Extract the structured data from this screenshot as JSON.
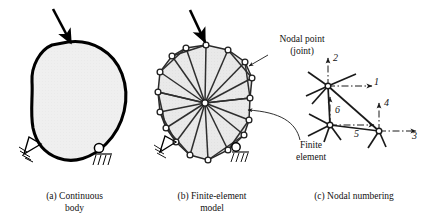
{
  "figure": {
    "panels": [
      {
        "id": "a",
        "caption_line1": "(a) Continuous",
        "caption_line2": "body"
      },
      {
        "id": "b",
        "caption_line1": "(b) Finite-element",
        "caption_line2": "model"
      },
      {
        "id": "c",
        "caption_line1": "(c) Nodal numbering",
        "caption_line2": ""
      }
    ],
    "annotations": [
      {
        "name": "nodal-point",
        "line1": "Nodal point",
        "line2": "(joint)"
      },
      {
        "name": "finite-element",
        "line1": "Finite",
        "line2": "element"
      }
    ],
    "dof_numbers": [
      "1",
      "2",
      "3",
      "4",
      "5",
      "6"
    ],
    "colors": {
      "body_fill": "#eeeeee",
      "outline": "#000000",
      "mesh_fill": "#e8e8e8",
      "node_fill": "#ffffff",
      "background": "#ffffff"
    }
  }
}
